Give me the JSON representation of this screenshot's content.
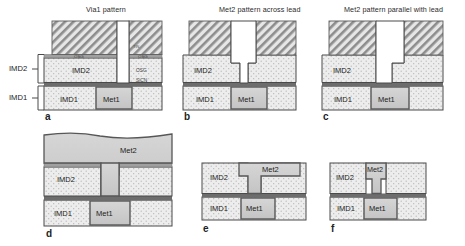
{
  "figure": {
    "caption_style": "semiconductor cross-section process panels",
    "panels": [
      {
        "id": "a",
        "label": "a",
        "title": "Via1 pattern",
        "layer_labels": [
          "IMD2",
          "IMD1",
          "Met1"
        ],
        "film_labels": [
          "OSG",
          "OSG",
          "OSG",
          "SiCN"
        ],
        "description": "Via1 hole etched through photoresist stack into IMD2 stopping above Met1"
      },
      {
        "id": "b",
        "label": "b",
        "title": "Met2 pattern across lead",
        "layer_labels": [
          "IMD2",
          "IMD1",
          "Met1"
        ],
        "description": "Dual damascene trench plus via stepped profile across the lead"
      },
      {
        "id": "c",
        "label": "c",
        "title": "Met2 pattern parallel with lead",
        "layer_labels": [
          "IMD2",
          "IMD1",
          "Met1"
        ],
        "description": "Dual damascene trench plus via profile parallel with the lead"
      },
      {
        "id": "d",
        "label": "d",
        "title": "",
        "layer_labels": [
          "Met2",
          "IMD2",
          "IMD1",
          "Met1"
        ],
        "description": "Met2 overburden after metal fill before CMP"
      },
      {
        "id": "e",
        "label": "e",
        "title": "",
        "layer_labels": [
          "Met2",
          "IMD2",
          "IMD1",
          "Met1"
        ],
        "description": "Met2 line across lead after CMP"
      },
      {
        "id": "f",
        "label": "f",
        "title": "",
        "layer_labels": [
          "Met2",
          "IMD2",
          "IMD1",
          "Met1"
        ],
        "description": "Met2 narrow plug parallel with lead after CMP"
      }
    ],
    "side_brackets": [
      {
        "label": "IMD2"
      },
      {
        "label": "IMD1"
      }
    ],
    "colors": {
      "imd_fill": "#ebebeb",
      "imd_dot": "#b9b9b9",
      "metal_fill": "#cdcdcd",
      "metal_stroke": "#5a5a5a",
      "resist_hatch": "#8e8e8e",
      "resist_fill": "#e2e2e2",
      "sicn_dark": "#6b6b6b",
      "osg_line": "#9a9a9a",
      "outline": "#4a4a4a",
      "text": "#222222"
    }
  }
}
